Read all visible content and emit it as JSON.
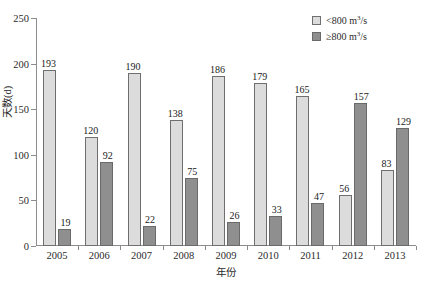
{
  "top_partial_text": "",
  "chart_data": {
    "type": "bar",
    "title": "",
    "xlabel": "年份",
    "ylabel": "天数(d)",
    "categories": [
      "2005",
      "2006",
      "2007",
      "2008",
      "2009",
      "2010",
      "2011",
      "2012",
      "2013"
    ],
    "series": [
      {
        "name": "< 800 m³/s",
        "legend_prefix": "<",
        "legend_value": "800",
        "legend_unit": "m",
        "legend_sup": "3",
        "legend_unit_tail": "/s",
        "color": "#dcdcdc",
        "values": [
          193,
          120,
          190,
          138,
          186,
          179,
          165,
          56,
          83
        ]
      },
      {
        "name": "≥ 800 m³/s",
        "legend_prefix": "≥",
        "legend_value": "800",
        "legend_unit": "m",
        "legend_sup": "3",
        "legend_unit_tail": "/s",
        "color": "#8f8f8f",
        "values": [
          19,
          92,
          22,
          75,
          26,
          33,
          47,
          157,
          129
        ]
      }
    ],
    "ylim": [
      0,
      250
    ],
    "yticks": [
      0,
      50,
      100,
      150,
      200,
      250
    ],
    "grid": false,
    "legend_position": "top-right"
  }
}
